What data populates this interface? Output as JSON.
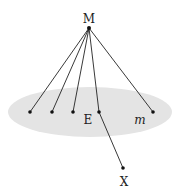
{
  "diagram": {
    "colors": {
      "plane_fill": "#e4e4e4",
      "line": "#222222",
      "point": "#111111",
      "background": "#ffffff"
    },
    "plane": {
      "label": "m",
      "cx": 90,
      "cy": 112,
      "rx": 82,
      "ry": 25
    },
    "apex": {
      "label": "M",
      "x": 89,
      "y": 28,
      "label_x": 89,
      "label_y": 23
    },
    "plane_points": [
      {
        "id": "p1",
        "x": 30,
        "y": 112
      },
      {
        "id": "p2",
        "x": 52,
        "y": 112
      },
      {
        "id": "p3",
        "x": 73,
        "y": 112
      },
      {
        "id": "E",
        "x": 99,
        "y": 112
      },
      {
        "id": "p5",
        "x": 153,
        "y": 112
      }
    ],
    "labels": {
      "E": {
        "text": "E",
        "x": 88,
        "y": 124
      },
      "m": {
        "text": "m",
        "x": 140,
        "y": 124
      },
      "X": {
        "text": "X",
        "x": 124,
        "y": 186
      }
    },
    "outside_point": {
      "label": "X",
      "x": 123,
      "y": 168
    }
  }
}
